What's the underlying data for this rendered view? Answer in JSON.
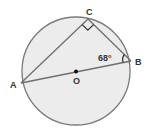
{
  "diagram": {
    "colors": {
      "circle_fill": "#ececec",
      "circle_stroke": "#7a7a7a",
      "line": "#6f6f6f",
      "label": "#333333",
      "center_dot": "#111111"
    },
    "points": {
      "A": {
        "label": "A"
      },
      "B": {
        "label": "B"
      },
      "C": {
        "label": "C"
      },
      "O": {
        "label": "O"
      }
    },
    "angle_B": {
      "value": "68°"
    },
    "right_angle_at": "C",
    "segments": [
      "AC",
      "CB",
      "AB (diameter through O)"
    ]
  }
}
